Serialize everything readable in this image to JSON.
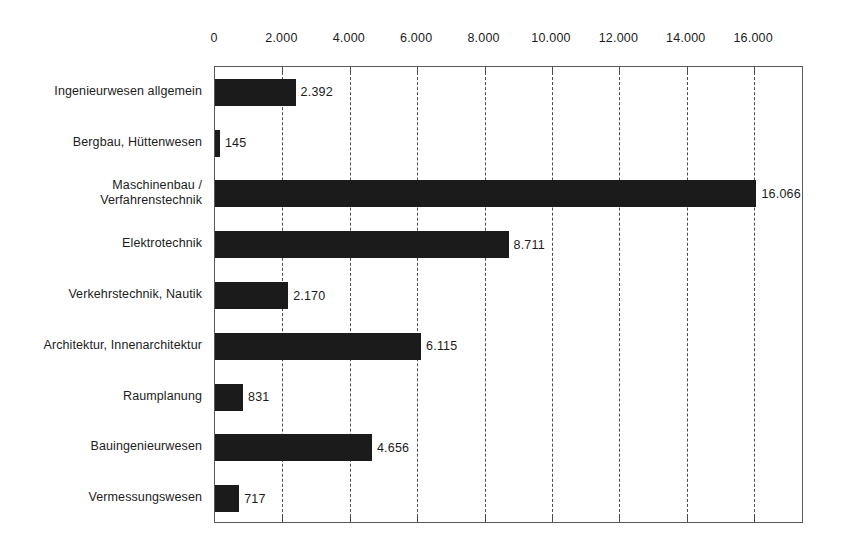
{
  "chart_data": {
    "type": "bar",
    "orientation": "horizontal",
    "title": "",
    "subtitle": "",
    "xlabel": "",
    "ylabel": "",
    "xlim": [
      0,
      17500
    ],
    "grid": true,
    "legend": null,
    "axis_position": "top",
    "number_format": "de-DE (thousands separator = '.')",
    "categories": [
      "Ingenieurwesen allgemein",
      "Bergbau, Hüttenwesen",
      "Maschinenbau /\nVerfahrenstechnik",
      "Elektrotechnik",
      "Verkehrstechnik, Nautik",
      "Architektur, Innenarchitektur",
      "Raumplanung",
      "Bauingenieurwesen",
      "Vermessungswesen"
    ],
    "values": [
      2392,
      145,
      16066,
      8711,
      2170,
      6115,
      831,
      4656,
      717
    ],
    "value_labels": [
      "2.392",
      "145",
      "16.066",
      "8.711",
      "2.170",
      "6.115",
      "831",
      "4.656",
      "717"
    ],
    "xticks": [
      0,
      2000,
      4000,
      6000,
      8000,
      10000,
      12000,
      14000,
      16000
    ],
    "xtick_labels": [
      "0",
      "2.000",
      "4.000",
      "6.000",
      "8.000",
      "10.000",
      "12.000",
      "14.000",
      "16.000"
    ],
    "bar_color": "#1b1b1b",
    "gridline_color": "#4d4d4d",
    "frame_color": "#5a5a5a",
    "background_color": "#ffffff"
  }
}
